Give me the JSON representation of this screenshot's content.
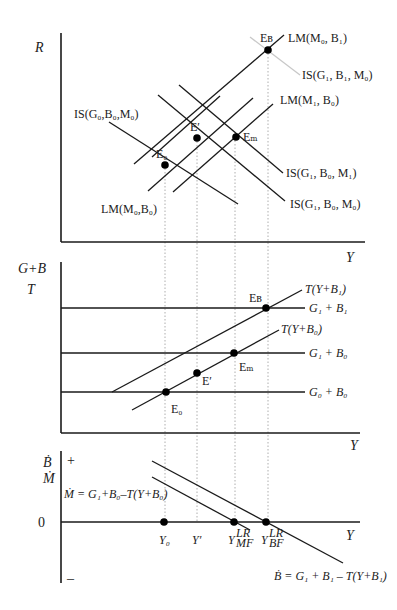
{
  "panels": {
    "top": {
      "y_axis_label": "R",
      "x_axis_label": "Y",
      "curves": [
        {
          "id": "lm_m0_b0",
          "label": "LM(M₀,B₀)"
        },
        {
          "id": "lm_m0_b1",
          "label": "LM(M₀, B₁)"
        },
        {
          "id": "lm_m1_b0",
          "label": "LM(M₁, B₀)"
        },
        {
          "id": "is_g0_b0_m0",
          "label": "IS(G₀,B₀,M₀)"
        },
        {
          "id": "is_g1_b1_m0",
          "label": "IS(G₁, B₁, M₀)"
        },
        {
          "id": "is_g1_b0_m1",
          "label": "IS(G₁, B₀, M₁)"
        },
        {
          "id": "is_g1_b0_m0",
          "label": "IS(G₁, B₀, M₀)"
        }
      ],
      "points": [
        {
          "id": "E0",
          "label": "E₀"
        },
        {
          "id": "Eprime",
          "label": "E′"
        },
        {
          "id": "EM",
          "label": "Eₘ"
        },
        {
          "id": "EB",
          "label": "Eʙ"
        }
      ]
    },
    "middle": {
      "y_axis_label_1": "G+B",
      "y_axis_label_2": "T",
      "x_axis_label": "Y",
      "curves": [
        {
          "id": "t_y_b1",
          "label": "T(Y+B₁)"
        },
        {
          "id": "t_y_b0",
          "label": "T(Y+B₀)"
        },
        {
          "id": "g1_b1",
          "label": "G₁ + B₁"
        },
        {
          "id": "g1_b0",
          "label": "G₁ + B₀"
        },
        {
          "id": "g0_b0",
          "label": "G₀ + B₀"
        }
      ],
      "points": [
        {
          "id": "E0",
          "label": "E₀"
        },
        {
          "id": "Eprime",
          "label": "E′"
        },
        {
          "id": "EM",
          "label": "Eₘ"
        },
        {
          "id": "EB",
          "label": "Eʙ"
        }
      ]
    },
    "bottom": {
      "y_axis_label_1": "Ḃ",
      "y_axis_label_2": "Ṁ",
      "plus_sign": "+",
      "minus_sign": "–",
      "zero_label": "0",
      "x_axis_label": "Y",
      "m_dot_equation": "Ṁ = G₁+B₀–T(Y+B₀)",
      "b_dot_equation": "Ḃ = G₁ + B₁ – T(Y+B₁)",
      "x_ticks": [
        {
          "id": "Y0",
          "label": "Y₀"
        },
        {
          "id": "Yprime",
          "label": "Y′"
        },
        {
          "id": "Y_MF_LR",
          "label": "Y",
          "sup": "LR",
          "sub": "MF"
        },
        {
          "id": "Y_BF_LR",
          "label": "Y",
          "sup": "LR",
          "sub": "BF"
        }
      ]
    }
  },
  "colors": {
    "line": "#1a1a1a",
    "gray_is": "#c8c8c8",
    "dotted": "#999999"
  }
}
